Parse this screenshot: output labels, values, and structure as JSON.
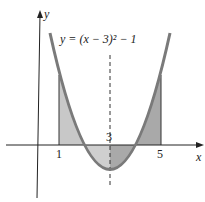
{
  "diagram": {
    "equation": "y = (x − 3)² − 1",
    "x_axis_label": "x",
    "y_axis_label": "y",
    "ticks": [
      "1",
      "3",
      "5"
    ],
    "colors": {
      "curve": "#7a7a7a",
      "shade_light": "#c8c8c8",
      "shade_dark": "#a9a9a9",
      "axis": "#222222"
    }
  }
}
